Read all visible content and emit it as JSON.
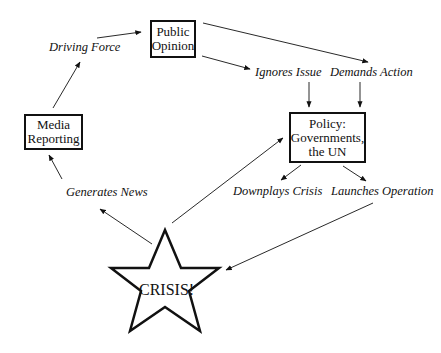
{
  "nodes": {
    "public_opinion": {
      "line1": "Public",
      "line2": "Opinion"
    },
    "media_reporting": {
      "line1": "Media",
      "line2": "Reporting"
    },
    "policy": {
      "line1": "Policy:",
      "line2": "Governments,",
      "line3": "the UN"
    },
    "crisis": {
      "label": "CRISIS!"
    }
  },
  "edge_labels": {
    "driving_force": "Driving Force",
    "ignores_issue": "Ignores Issue",
    "demands_action": "Demands Action",
    "generates_news": "Generates News",
    "downplays_crisis": "Downplays Crisis",
    "launches_operation": "Launches Operation"
  },
  "colors": {
    "stroke": "#111111",
    "background": "#ffffff"
  }
}
